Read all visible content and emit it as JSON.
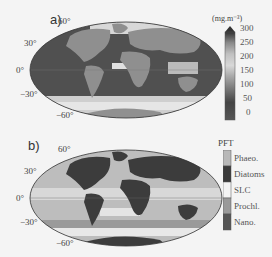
{
  "figure": {
    "panels": [
      {
        "label": "a)",
        "projection": "Mollweide",
        "lat_labels": [
          "60°",
          "30°",
          "0°",
          "−30°",
          "−60°"
        ],
        "colorbar": {
          "title": "(mg.m⁻³)",
          "ticks": [
            "300",
            "250",
            "200",
            "150",
            "100",
            "50",
            "0"
          ],
          "range": [
            0,
            300
          ],
          "extend": "max"
        }
      },
      {
        "label": "b)",
        "projection": "Mollweide",
        "lat_labels": [
          "60°",
          "30°",
          "0°",
          "−30°",
          "−60°"
        ],
        "colorbar": {
          "title": "PFT",
          "categories": [
            "Phaeo.",
            "Diatoms",
            "SLC",
            "Prochl.",
            "Nano."
          ],
          "colors": [
            "#b8b8b8",
            "#3a3a3a",
            "#f4f4f4",
            "#9a9a9a",
            "#555555"
          ]
        }
      }
    ]
  },
  "colors": {
    "land_a": "#8f8f8f",
    "ocean_low": "#4a4a4a",
    "ocean_high": "#e8e8e8",
    "land_b": "#3c3c3c",
    "ocean_b": "#bdbdbd"
  }
}
